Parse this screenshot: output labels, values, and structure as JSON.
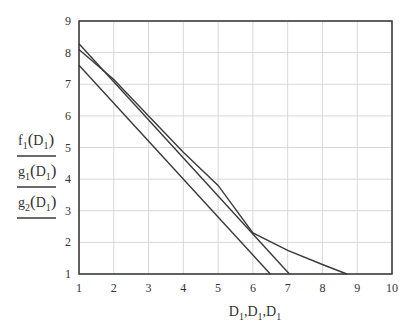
{
  "chart_data": {
    "type": "line",
    "title": "",
    "xlabel": "D1,D1,D1",
    "ylabel": "f1(D1) / g1(D1) / g2(D1)",
    "xlim": [
      1,
      10
    ],
    "ylim": [
      1,
      9
    ],
    "x_ticks": [
      1,
      2,
      3,
      4,
      5,
      6,
      7,
      8,
      9,
      10
    ],
    "y_ticks": [
      1,
      2,
      3,
      4,
      5,
      6,
      7,
      8,
      9
    ],
    "grid": true,
    "legend_position": "left of y-axis (as stacked axis labels with line samples)",
    "series": [
      {
        "name": "f1(D1)",
        "x": [
          1,
          2,
          3,
          4,
          5,
          6,
          7,
          8,
          8.7
        ],
        "y": [
          8.1,
          7.15,
          6.0,
          4.85,
          3.8,
          2.3,
          1.75,
          1.3,
          1.0
        ]
      },
      {
        "name": "g1(D1)",
        "x": [
          1,
          7.05
        ],
        "y": [
          8.28,
          1.0
        ]
      },
      {
        "name": "g2(D1)",
        "x": [
          1,
          6.5
        ],
        "y": [
          7.6,
          1.0
        ]
      }
    ]
  },
  "axis": {
    "x_label_parts": [
      {
        "base": "D",
        "sub": "1"
      },
      {
        "base": "D",
        "sub": "1"
      },
      {
        "base": "D",
        "sub": "1"
      }
    ],
    "y_labels": [
      {
        "fn": "f",
        "fn_sub": "1",
        "arg": "D",
        "arg_sub": "1"
      },
      {
        "fn": "g",
        "fn_sub": "1",
        "arg": "D",
        "arg_sub": "1"
      },
      {
        "fn": "g",
        "fn_sub": "2",
        "arg": "D",
        "arg_sub": "1"
      }
    ]
  },
  "colors": {
    "line": "#3a3a3a",
    "grid": "#d8d8d8",
    "axis": "#333333"
  }
}
